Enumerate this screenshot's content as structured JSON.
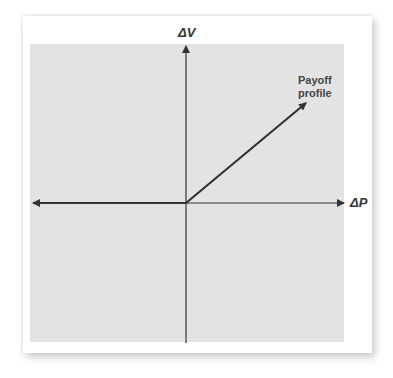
{
  "diagram": {
    "vertical_axis_label": "ΔV",
    "horizontal_axis_label": "ΔP",
    "curve_label_line1": "Payoff",
    "curve_label_line2": "profile",
    "colors": {
      "background": "#ffffff",
      "plot_area": "#e3e3e3",
      "axis": "#333333",
      "payoff_line": "#333333"
    }
  }
}
